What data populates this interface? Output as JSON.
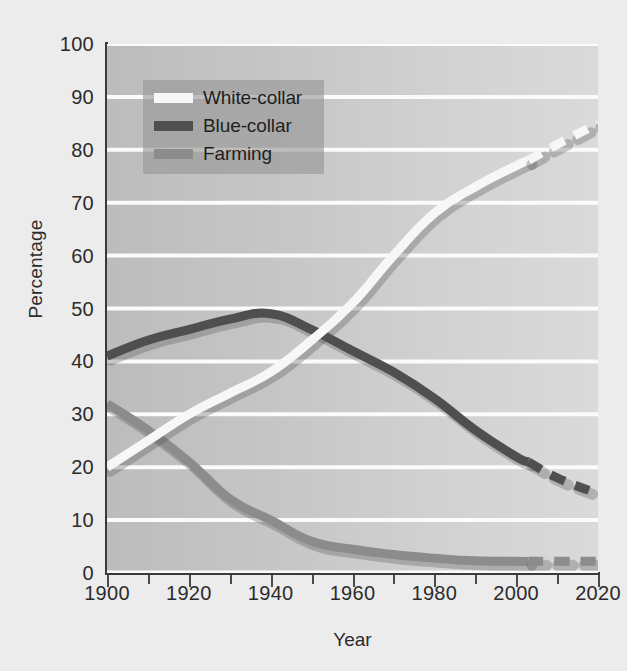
{
  "chart_data": {
    "type": "line",
    "title": "",
    "xlabel": "Year",
    "ylabel": "Percentage",
    "xlim": [
      1900,
      2020
    ],
    "ylim": [
      0,
      100
    ],
    "grid": true,
    "legend_position": "upper-left-inside",
    "xticks": [
      "1900",
      "1920",
      "1940",
      "1960",
      "1980",
      "2000",
      "2020"
    ],
    "xtick_values": [
      1900,
      1920,
      1940,
      1960,
      1980,
      2000,
      2020
    ],
    "minor_xtick_values": [
      1910,
      1930,
      1950,
      1970,
      1990,
      2010
    ],
    "yticks": [
      "0",
      "10",
      "20",
      "30",
      "40",
      "50",
      "60",
      "70",
      "80",
      "90",
      "100"
    ],
    "ytick_values": [
      0,
      10,
      20,
      30,
      40,
      50,
      60,
      70,
      80,
      90,
      100
    ],
    "x": [
      1900,
      1910,
      1920,
      1930,
      1940,
      1950,
      1960,
      1970,
      1980,
      1990,
      2000,
      2003
    ],
    "x_projected": [
      2003,
      2010,
      2020
    ],
    "series": [
      {
        "name": "White-collar",
        "color": "#f7f7f7",
        "values": [
          20,
          25,
          30,
          34,
          38,
          44,
          51,
          60,
          68,
          73,
          77,
          78
        ],
        "projected_values": [
          78,
          81,
          85
        ],
        "projected_style": "dashed"
      },
      {
        "name": "Blue-collar",
        "color": "#4f4f4f",
        "values": [
          41,
          44,
          46,
          48,
          49,
          46,
          42,
          38,
          33,
          27,
          22,
          21
        ],
        "projected_values": [
          21,
          18,
          15
        ],
        "projected_style": "dashed"
      },
      {
        "name": "Farming",
        "color": "#8c8c8c",
        "values": [
          32,
          27,
          21,
          14,
          10,
          6,
          4.5,
          3.5,
          2.8,
          2.3,
          2.2,
          2.2
        ],
        "projected_values": [
          2.2,
          2.2,
          2.2
        ],
        "projected_style": "dashed"
      }
    ]
  },
  "legend": {
    "items": [
      {
        "label": "White-collar",
        "color": "#f7f7f7"
      },
      {
        "label": "Blue-collar",
        "color": "#4f4f4f"
      },
      {
        "label": "Farming",
        "color": "#8c8c8c"
      }
    ]
  },
  "axes": {
    "y_axis_title": "Percentage",
    "x_axis_title": "Year"
  }
}
